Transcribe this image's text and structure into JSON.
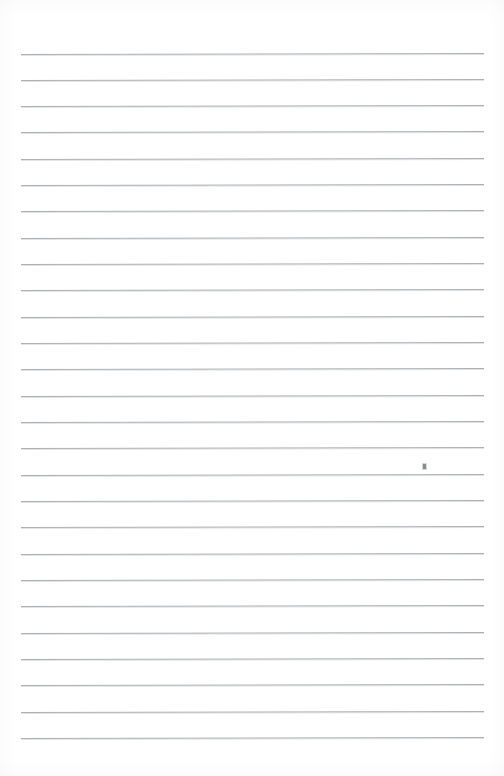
{
  "document": {
    "kind": "lined-paper-scan",
    "title": "Blank Ruled Notepad Page",
    "page_label": "",
    "body_text": "",
    "background_color": "#ffffff",
    "paper_color": "#ffffff"
  },
  "ruling": {
    "line_color": "#a9adb1",
    "line_count": 27,
    "first_line_y": 53.5,
    "line_spacing": 26.33,
    "left_margin_x": 21,
    "right_margin_x": 484,
    "line_thickness": 1,
    "slant_degrees": -0.12,
    "has_vertical_margin_rule": false,
    "has_header_rule": false
  },
  "marks": [
    {
      "name": "pencil-tick",
      "x": 423,
      "y": 464,
      "width": 3,
      "height": 5,
      "color": "#7c8084",
      "on_line_index": 16
    }
  ],
  "content": {
    "written_text": "",
    "notes": ""
  }
}
